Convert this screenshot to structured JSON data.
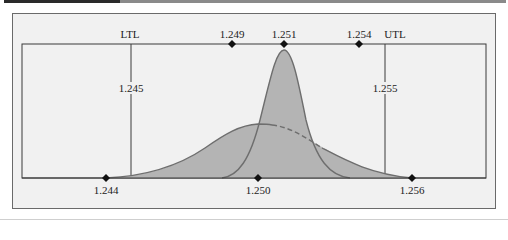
{
  "diagram": {
    "spec_limits": {
      "lower": {
        "label": "LTL",
        "value": "1.245"
      },
      "upper": {
        "label": "UTL",
        "value": "1.255"
      }
    },
    "top_markers": [
      {
        "label": "1.249",
        "x": 232
      },
      {
        "label": "1.251",
        "x": 284
      },
      {
        "label": "1.254",
        "x": 359
      }
    ],
    "bottom_markers": [
      {
        "label": "1.244",
        "x": 106
      },
      {
        "label": "1.250",
        "x": 258
      },
      {
        "label": "1.256",
        "x": 412
      }
    ],
    "distributions": [
      {
        "name": "narrow-distribution",
        "description": "Tall narrow normal curve centered at 1.251, spanning 1.249 to 1.254"
      },
      {
        "name": "wide-distribution",
        "description": "Wide flat normal curve centered near 1.250, spanning 1.244 to 1.256, with dashed portion inside the narrow curve"
      }
    ],
    "colors": {
      "fill": "#b4b4b4",
      "curve_stroke": "#6e6e6e",
      "line": "#3a3a3a",
      "background": "#f1f1f1",
      "frame": "#6a6a6a",
      "marker": "#111111"
    }
  }
}
